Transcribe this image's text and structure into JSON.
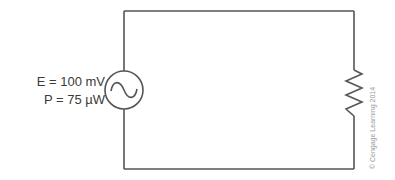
{
  "source": {
    "symbol": "ac-voltage-source",
    "voltage_label": "E = 100 mV",
    "power_label": "P = 75 µW"
  },
  "load": {
    "symbol": "resistor"
  },
  "copyright": "© Cengage Learning 2014",
  "colors": {
    "wire": "#555555",
    "text": "#3a3a3a",
    "copyright": "#9a9a9a"
  }
}
